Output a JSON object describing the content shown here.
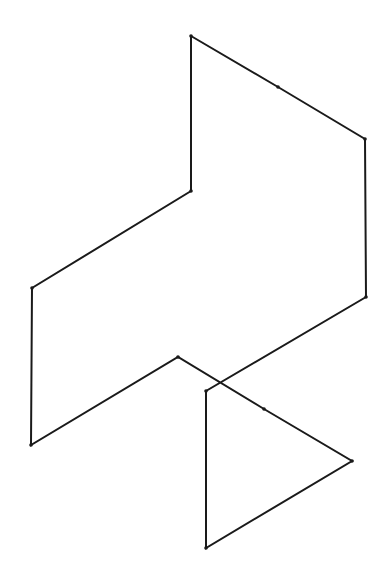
{
  "diagram": {
    "type": "line-drawing",
    "stroke_color": "#1a1a1a",
    "background": "#ffffff",
    "main_path": [
      [
        191,
        36
      ],
      [
        278,
        87
      ],
      [
        365,
        139
      ],
      [
        366,
        297
      ],
      [
        206,
        391
      ],
      [
        206,
        548
      ],
      [
        352,
        461
      ],
      [
        264,
        409
      ],
      [
        178,
        357
      ],
      [
        31,
        445
      ],
      [
        32,
        288
      ],
      [
        191,
        191
      ],
      [
        191,
        36
      ]
    ],
    "vertices": [
      {
        "x": 191,
        "y": 36
      },
      {
        "x": 278,
        "y": 87
      },
      {
        "x": 365,
        "y": 139
      },
      {
        "x": 191,
        "y": 191
      },
      {
        "x": 32,
        "y": 288
      },
      {
        "x": 366,
        "y": 297
      },
      {
        "x": 178,
        "y": 357
      },
      {
        "x": 206,
        "y": 391
      },
      {
        "x": 264,
        "y": 409
      },
      {
        "x": 31,
        "y": 445
      },
      {
        "x": 352,
        "y": 461
      },
      {
        "x": 206,
        "y": 548
      }
    ]
  }
}
